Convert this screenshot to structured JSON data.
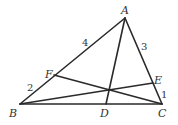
{
  "diagram": {
    "type": "triangle-cevians",
    "points": {
      "A": {
        "x": 125,
        "y": 18
      },
      "B": {
        "x": 20,
        "y": 104
      },
      "C": {
        "x": 162,
        "y": 104
      },
      "D": {
        "x": 106,
        "y": 104
      },
      "E": {
        "x": 153,
        "y": 83
      },
      "F": {
        "x": 54,
        "y": 75
      }
    },
    "segments": [
      {
        "from": "A",
        "to": "B"
      },
      {
        "from": "B",
        "to": "C"
      },
      {
        "from": "C",
        "to": "A"
      },
      {
        "from": "A",
        "to": "D"
      },
      {
        "from": "B",
        "to": "E"
      },
      {
        "from": "C",
        "to": "F"
      }
    ],
    "vertex_labels": {
      "A": "A",
      "B": "B",
      "C": "C",
      "D": "D",
      "E": "E",
      "F": "F"
    },
    "length_labels": {
      "AF": "4",
      "FB": "2",
      "AE": "3",
      "EC": "1"
    },
    "line_color": "#2a2a2a",
    "text_color": "#333333"
  }
}
